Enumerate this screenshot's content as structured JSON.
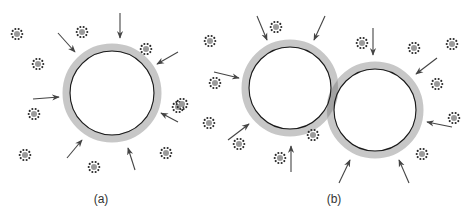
{
  "figure": {
    "colors": {
      "shell": "#bdbdbd",
      "shell_overlap": "#8a8a8a",
      "membrane": "#1a1a1a",
      "arrow": "#444444",
      "micelle_dot": "#2a2a2a",
      "micelle_core": "#9a9a9a",
      "label": "#333333"
    },
    "panels": [
      {
        "id": "a",
        "label": "(a)",
        "label_pos": [
          101,
          192
        ],
        "droplets": [
          {
            "cx": 112,
            "cy": 93,
            "r_outer": 49,
            "r_inner": 42
          }
        ],
        "micelles": [
          [
            17,
            34
          ],
          [
            82,
            32
          ],
          [
            38,
            64
          ],
          [
            146,
            49
          ],
          [
            34,
            114
          ],
          [
            178,
            107
          ],
          [
            25,
            155
          ],
          [
            166,
            153
          ],
          [
            94,
            167
          ]
        ],
        "arrows": [
          [
            120,
            13,
            120,
            38
          ],
          [
            58,
            33,
            75,
            52
          ],
          [
            178,
            52,
            157,
            64
          ],
          [
            33,
            99,
            59,
            97
          ],
          [
            178,
            122,
            161,
            113
          ],
          [
            67,
            158,
            82,
            140
          ],
          [
            135,
            170,
            128,
            148
          ]
        ]
      },
      {
        "id": "b",
        "label": "(b)",
        "label_pos": [
          334,
          192
        ],
        "droplets": [
          {
            "cx": 290,
            "cy": 88,
            "r_outer": 48,
            "r_inner": 41
          },
          {
            "cx": 375,
            "cy": 110,
            "r_outer": 48,
            "r_inner": 41
          }
        ],
        "micelles": [
          [
            210,
            41
          ],
          [
            276,
            27
          ],
          [
            215,
            83
          ],
          [
            182,
            104
          ],
          [
            209,
            123
          ],
          [
            239,
            144
          ],
          [
            280,
            158
          ],
          [
            313,
            135
          ],
          [
            362,
            43
          ],
          [
            414,
            48
          ],
          [
            452,
            44
          ],
          [
            437,
            84
          ],
          [
            454,
            118
          ],
          [
            422,
            154
          ]
        ],
        "arrows": [
          [
            257,
            16,
            267,
            40
          ],
          [
            325,
            16,
            314,
            40
          ],
          [
            373,
            28,
            373,
            55
          ],
          [
            437,
            58,
            416,
            74
          ],
          [
            214,
            72,
            239,
            78
          ],
          [
            228,
            140,
            249,
            124
          ],
          [
            291,
            172,
            291,
            146
          ],
          [
            452,
            127,
            427,
            122
          ],
          [
            339,
            183,
            350,
            160
          ],
          [
            409,
            183,
            399,
            160
          ]
        ]
      }
    ]
  }
}
